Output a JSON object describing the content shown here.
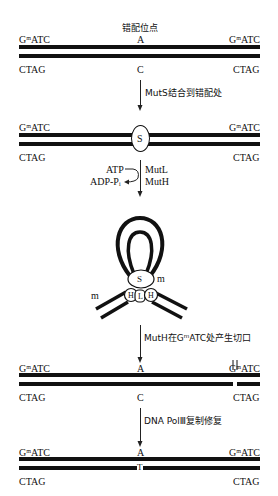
{
  "stage1": {
    "heading": "错配位点",
    "top_left": "GᵐATC",
    "top_mid": "A",
    "top_right": "GᵐATC",
    "bot_left": "CTAG",
    "bot_mid": "C",
    "bot_right": "CTAG"
  },
  "step1": {
    "label": "MutS结合到错配处"
  },
  "stage2": {
    "top_left": "GᵐATC",
    "top_right": "GᵐATC",
    "bot_left": "CTAG",
    "bot_right": "CTAG",
    "protein": "S"
  },
  "step2": {
    "atp": "ATP",
    "adp": "ADP-Pᵢ",
    "mutl": "MutL",
    "muth": "MutH"
  },
  "stage3": {
    "s": "S",
    "h1": "H",
    "l": "L",
    "h2": "H",
    "m1": "m",
    "m2": "m"
  },
  "step3": {
    "label": "MutH在GᵐATC处产生切口"
  },
  "stage4": {
    "top_left": "GᵐATC",
    "top_mid": "A",
    "top_right": "GᵐATC",
    "bot_left": "CTAG",
    "bot_mid": "C",
    "bot_right": "CTAG"
  },
  "step4": {
    "label": "DNA PolⅢ复制修复"
  },
  "stage5": {
    "top_left": "GᵐATC",
    "top_mid": "A",
    "top_right": "GᵐATC",
    "bot_left": "CTAG",
    "bot_mid": "T",
    "bot_right": "CTAG"
  }
}
